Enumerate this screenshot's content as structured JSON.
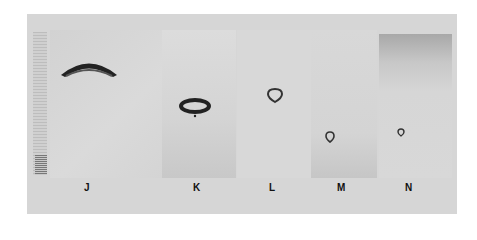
{
  "figure": {
    "type": "photographic-panel-figure",
    "panels": [
      {
        "label": "J",
        "description": "large dark crescent/dome-shaped ring object near top, ruler scale on left edge"
      },
      {
        "label": "K",
        "description": "elliptical dark ring with small dot beneath"
      },
      {
        "label": "L",
        "description": "small teardrop-shaped ring"
      },
      {
        "label": "M",
        "description": "small teardrop-shaped ring, lower position"
      },
      {
        "label": "N",
        "description": "very small teardrop-shaped ring, darker gradient background at top"
      }
    ],
    "colors": {
      "background": "#d6d6d6",
      "object": "#2a2a2a",
      "label": "#111111"
    }
  }
}
